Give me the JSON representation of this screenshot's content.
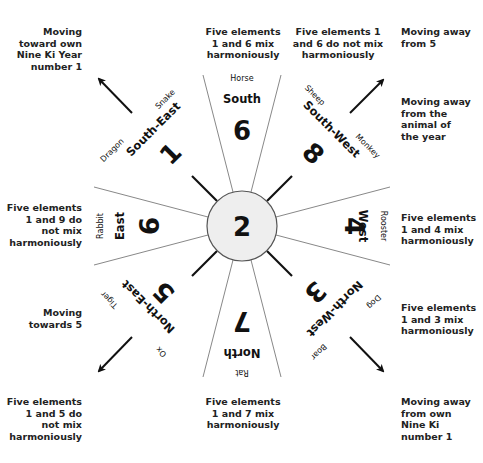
{
  "diagram": {
    "center": {
      "number": "2"
    },
    "sectors": [
      {
        "id": "south",
        "direction": "South",
        "number": "6",
        "animals": [
          "Horse"
        ],
        "note": "Five elements 1 and 6 mix harmoniously"
      },
      {
        "id": "south-west",
        "direction": "South-West",
        "number": "8",
        "animals": [
          "Sheep",
          "Monkey"
        ],
        "note": "Five elements 1 and 6 do not mix harmoniously"
      },
      {
        "id": "west",
        "direction": "West",
        "number": "4",
        "animals": [
          "Rooster"
        ],
        "note": "Five elements 1 and 4 mix harmoniously"
      },
      {
        "id": "north-west",
        "direction": "North-West",
        "number": "3",
        "animals": [
          "Dog",
          "Boar"
        ],
        "note": "Five elements 1 and 3 mix harmoniously"
      },
      {
        "id": "north",
        "direction": "North",
        "number": "7",
        "animals": [
          "Rat"
        ],
        "note": "Five elements 1 and 7 mix harmoniously"
      },
      {
        "id": "north-east",
        "direction": "North-East",
        "number": "5",
        "animals": [
          "Ox",
          "Tiger"
        ],
        "note": "Five elements 1 and 5 do not mix harmoniously"
      },
      {
        "id": "east",
        "direction": "East",
        "number": "9",
        "animals": [
          "Rabbit"
        ],
        "note": "Five elements 1 and 9 do not mix harmoniously"
      },
      {
        "id": "south-east",
        "direction": "South-East",
        "number": "1",
        "animals": [
          "Snake",
          "Dragon"
        ],
        "note": ""
      }
    ],
    "arrow_notes": {
      "upper_left": "Moving toward own Nine Ki Year number 1",
      "upper_right": "Moving away from 5",
      "right_upper": "Moving away from the animal of the year",
      "lower_left": "Moving towards 5",
      "lower_right": "Moving away from own Nine Ki number 1"
    },
    "notes_text": {
      "top_center": [
        "Five elements",
        "1 and 6 mix",
        "harmoniously"
      ],
      "top_right": [
        "Five elements 1",
        "and 6 do not mix",
        "harmoniously"
      ],
      "far_top_right": [
        "Moving away",
        "from 5"
      ],
      "far_right_upper": [
        "Moving away",
        "from the",
        "animal of",
        "the year"
      ],
      "top_left": [
        "Moving",
        "toward own",
        "Nine Ki Year",
        "number 1"
      ],
      "left": [
        "Five elements",
        "1 and 9 do",
        "not mix",
        "harmoniously"
      ],
      "right": [
        "Five elements",
        "1 and 4 mix",
        "harmoniously"
      ],
      "lower_left_arrow": [
        "Moving",
        "towards 5"
      ],
      "lower_right_notes": [
        "Five elements",
        "1 and 3 mix",
        "harmoniously"
      ],
      "bottom_left": [
        "Five elements",
        "1 and 5 do",
        "not mix",
        "harmoniously"
      ],
      "bottom_center": [
        "Five elements",
        "1 and 7 mix",
        "harmoniously"
      ],
      "bottom_right": [
        "Moving away",
        "from own",
        "Nine Ki",
        "number 1"
      ]
    },
    "colors": {
      "line": "#888888",
      "spoke": "#111111",
      "center_fill": "#eeeeee",
      "text": "#111111"
    }
  }
}
